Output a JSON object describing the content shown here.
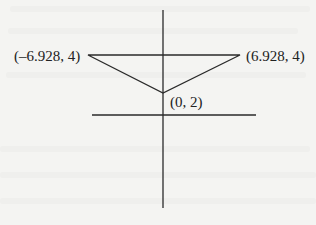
{
  "diagram": {
    "type": "coordinate-diagram",
    "line_color": "#2a2a2a",
    "background_color": "#f4f4f2",
    "axes": {
      "x_axis": {
        "x1": 92,
        "y1": 115,
        "x2": 256,
        "y2": 115
      },
      "y_axis": {
        "x1": 163,
        "y1": 10,
        "x2": 163,
        "y2": 208
      }
    },
    "triangle": {
      "vertices": [
        {
          "label": "(–6.928, 4)",
          "x": -6.928,
          "y": 4,
          "px": 88,
          "py": 55
        },
        {
          "label": "(6.928, 4)",
          "x": 6.928,
          "y": 4,
          "px": 240,
          "py": 55
        },
        {
          "label": "(0, 2)",
          "x": 0,
          "y": 2,
          "px": 163,
          "py": 93
        }
      ]
    },
    "labels": {
      "left_vertex": "(–6.928, 4)",
      "right_vertex": "(6.928, 4)",
      "bottom_vertex": "(0, 2)"
    }
  }
}
